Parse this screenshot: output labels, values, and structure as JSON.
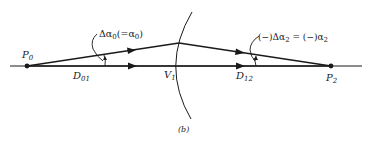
{
  "figure": {
    "caption": "(b)",
    "points": {
      "p0": {
        "main": "P",
        "sub": "0"
      },
      "p2": {
        "main": "P",
        "sub": "2"
      },
      "v1": {
        "main": "V",
        "sub": "1"
      }
    },
    "distances": {
      "d01": {
        "main": "D",
        "sub": "01"
      },
      "d12": {
        "main": "D",
        "sub": "12"
      }
    },
    "angles": {
      "left": {
        "prefix": "Δα",
        "sub": "0",
        "mid": "(=α",
        "sub2": "0",
        "suffix": ")"
      },
      "right": {
        "prefix": "(−)Δα",
        "sub": "2",
        "mid": " = (−)α",
        "sub2": "2",
        "suffix": ""
      }
    },
    "colors": {
      "ink": "#1a1a1a",
      "background": "#ffffff"
    }
  }
}
